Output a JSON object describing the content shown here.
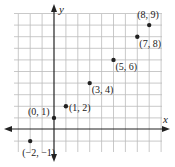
{
  "chart_data": {
    "type": "scatter",
    "title": "",
    "xlabel": "x",
    "ylabel": "y",
    "xlim": [
      -4,
      9
    ],
    "ylim": [
      -2,
      10
    ],
    "grid": true,
    "points": [
      {
        "x": -2,
        "y": -1,
        "label": "(−2, −1)"
      },
      {
        "x": 0,
        "y": 1,
        "label": "(0, 1)"
      },
      {
        "x": 1,
        "y": 2,
        "label": "(1, 2)"
      },
      {
        "x": 3,
        "y": 4,
        "label": "(3, 4)"
      },
      {
        "x": 5,
        "y": 6,
        "label": "(5, 6)"
      },
      {
        "x": 7,
        "y": 8,
        "label": "(7, 8)"
      },
      {
        "x": 8,
        "y": 9,
        "label": "(8, 9)"
      }
    ]
  },
  "axes": {
    "x_label": "x",
    "y_label": "y"
  }
}
